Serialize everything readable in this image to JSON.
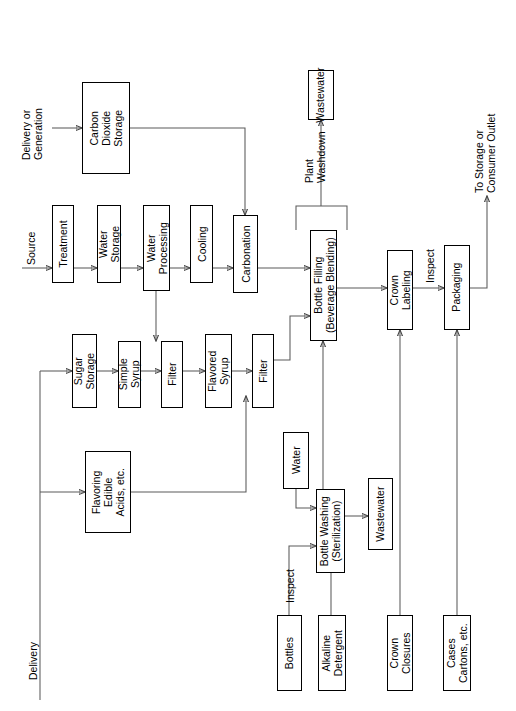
{
  "diagram": {
    "orientation": "rotated-90-ccw",
    "nodes": {
      "carbon_dioxide_storage": "Carbon\nDioxide\nStorage",
      "treatment": "Treatment",
      "water_storage": "Water\nStorage",
      "water_processing": "Water\nProcessing",
      "cooling": "Cooling",
      "carbonation": "Carbonation",
      "sugar_storage": "Sugar\nStorage",
      "simple_syrup": "Simple\nSyrup",
      "filter_1": "Filter",
      "flavored_syrup": "Flavored\nSyrup",
      "filter_2": "Filter",
      "flavoring": "Flavoring\nEdible\nAcids, etc.",
      "bottle_filling": "Bottle Filling\n(Beverage Blending)",
      "crown_labeling": "Crown\nLabeling",
      "packaging": "Packaging",
      "wastewater_top": "Wastewater",
      "water_wash": "Water",
      "bottle_washing": "Bottle Washing\n(Sterilization)",
      "wastewater_bottom": "Wastewater",
      "bottles": "Bottles",
      "alkaline_detergent": "Alkaline\nDetergent",
      "crown_closures": "Crown\nClosures",
      "cases_cartons": "Cases\nCartons, etc."
    },
    "edge_labels": {
      "delivery_or_generation": "Delivery or\nGeneration",
      "source": "Source",
      "plant_washdown": "Plant\nWashdown",
      "inspect_1": "Inspect",
      "to_storage": "To Storage or\nConsumer Outlet",
      "inspect_2": "Inspect",
      "delivery": "Delivery"
    },
    "colors": {
      "line": "#454545",
      "box_border": "#000000",
      "background": "#ffffff",
      "text": "#000000"
    }
  }
}
